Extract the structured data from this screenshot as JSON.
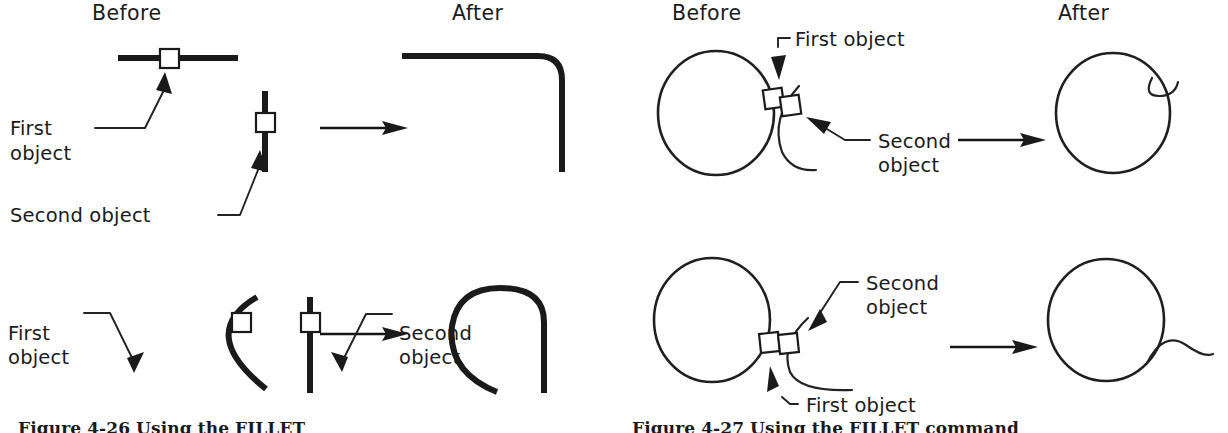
{
  "figure_left": {
    "id": "figure-4-26",
    "caption": "Figure 4-26  Using the FILLET",
    "headers": {
      "before": "Before",
      "after": "After"
    },
    "panels": [
      {
        "name": "line-line-fillet",
        "before_objects": [
          "horizontal line",
          "vertical line"
        ],
        "labels": {
          "first_object_line1": "First",
          "first_object_line2": "object",
          "second_object_line1": "Second object"
        },
        "after_result": "rounded corner joining the two lines"
      },
      {
        "name": "arc-line-fillet",
        "before_objects": [
          "arc",
          "vertical line"
        ],
        "labels": {
          "first_object_line1": "First",
          "first_object_line2": "object",
          "second_object_line1": "Second",
          "second_object_line2": "object"
        },
        "after_result": "arc filleted to line forming closed loop top"
      }
    ]
  },
  "figure_right": {
    "id": "figure-4-27",
    "caption": "Figure 4-27  Using the FILLET command",
    "headers": {
      "before": "Before",
      "after": "After"
    },
    "panels": [
      {
        "name": "circle-arc-fillet-outside",
        "before_objects": [
          "circle",
          "arc"
        ],
        "labels": {
          "first_object": "First  object",
          "second_object_line1": "Second",
          "second_object_line2": "object"
        },
        "after_result": "circle unchanged with short arc tail at upper right"
      },
      {
        "name": "circle-arc-fillet-tangent",
        "before_objects": [
          "circle",
          "arc"
        ],
        "labels": {
          "second_object_line1": "Second",
          "second_object_line2": "object",
          "first_object": "First  object"
        },
        "after_result": "circle with S-curve tail extending to the right"
      }
    ]
  },
  "colors": {
    "ink": "#1a1a1a",
    "paper": "#fefefe",
    "thin_ink": "#222222"
  }
}
